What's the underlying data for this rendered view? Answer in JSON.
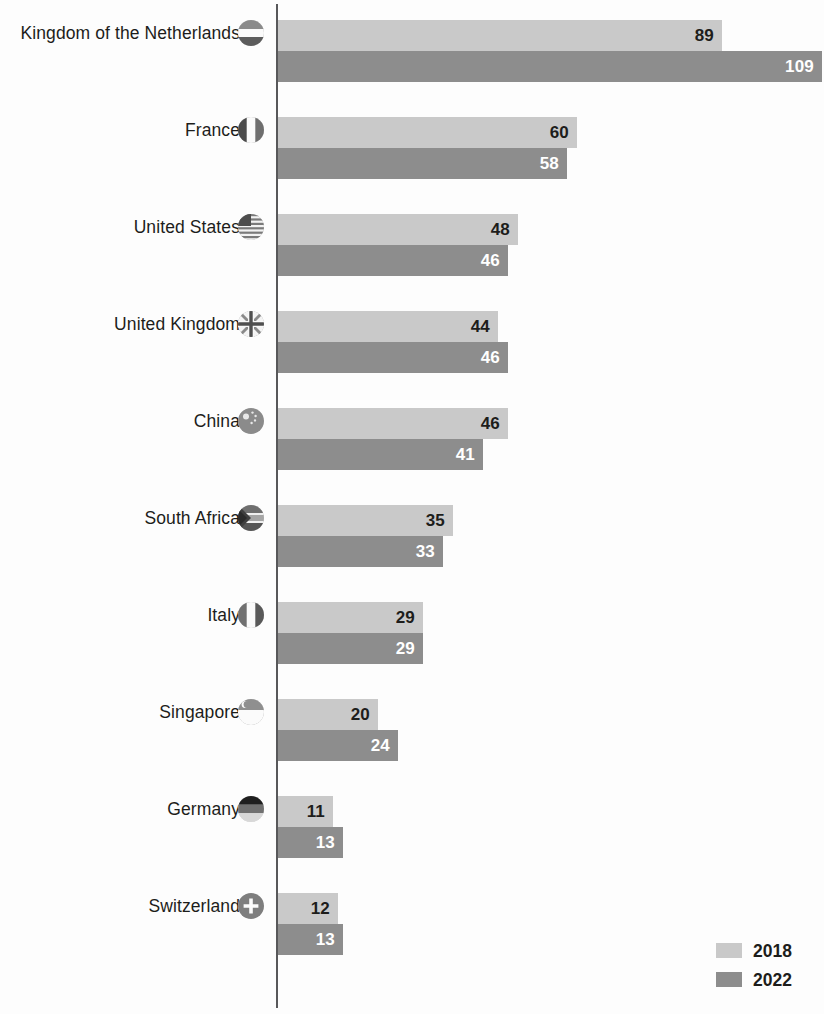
{
  "chart_data": {
    "type": "bar",
    "orientation": "horizontal",
    "grouped": true,
    "title": "",
    "subtitle": "",
    "xlabel": "",
    "ylabel": "",
    "grid": false,
    "legend_position": "bottom-right",
    "xlim": [
      0,
      109
    ],
    "categories": [
      "Kingdom of the Netherlands",
      "France",
      "United States",
      "United Kingdom",
      "China",
      "South Africa",
      "Italy",
      "Singapore",
      "Germany",
      "Switzerland"
    ],
    "series": [
      {
        "name": "2018",
        "color": "#c9c9c9",
        "values": [
          89,
          60,
          48,
          44,
          46,
          35,
          29,
          20,
          11,
          12
        ]
      },
      {
        "name": "2022",
        "color": "#8d8d8d",
        "values": [
          109,
          58,
          46,
          46,
          41,
          33,
          29,
          24,
          13,
          13
        ]
      }
    ]
  },
  "legend": {
    "items": [
      {
        "label": "2018",
        "color": "#c9c9c9"
      },
      {
        "label": "2022",
        "color": "#8d8d8d"
      }
    ]
  },
  "rows": [
    {
      "country": "Kingdom of the Netherlands",
      "flag": "flag-netherlands-icon",
      "v2018": 89,
      "v2022": 109
    },
    {
      "country": "France",
      "flag": "flag-france-icon",
      "v2018": 60,
      "v2022": 58
    },
    {
      "country": "United States",
      "flag": "flag-united-states-icon",
      "v2018": 48,
      "v2022": 46
    },
    {
      "country": "United Kingdom",
      "flag": "flag-united-kingdom-icon",
      "v2018": 44,
      "v2022": 46
    },
    {
      "country": "China",
      "flag": "flag-china-icon",
      "v2018": 46,
      "v2022": 41
    },
    {
      "country": "South Africa",
      "flag": "flag-south-africa-icon",
      "v2018": 35,
      "v2022": 33
    },
    {
      "country": "Italy",
      "flag": "flag-italy-icon",
      "v2018": 29,
      "v2022": 29
    },
    {
      "country": "Singapore",
      "flag": "flag-singapore-icon",
      "v2018": 20,
      "v2022": 24
    },
    {
      "country": "Germany",
      "flag": "flag-germany-icon",
      "v2018": 11,
      "v2022": 13
    },
    {
      "country": "Switzerland",
      "flag": "flag-switzerland-icon",
      "v2018": 12,
      "v2022": 13
    }
  ],
  "colors": {
    "series_2018": "#c9c9c9",
    "series_2022": "#8d8d8d",
    "axis": "#58585a",
    "text": "#1d1d1b",
    "value_text_on_dark": "#ffffff",
    "background": "#fdfdfd"
  },
  "scale": {
    "px_per_unit": 4.99,
    "axis_x_px": 277,
    "row_height_px": 97,
    "bar_height_px": 31
  }
}
